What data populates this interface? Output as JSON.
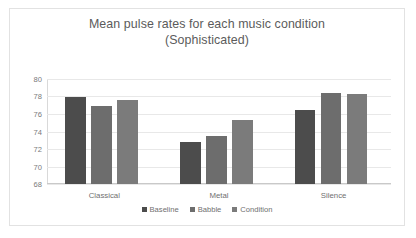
{
  "chart_data": {
    "type": "bar",
    "title": "Mean pulse rates for each music condition (Sophisticated)",
    "title_line1": "Mean pulse rates for each music condition",
    "title_line2": "(Sophisticated)",
    "xlabel": "",
    "ylabel": "",
    "categories": [
      "Classical",
      "Metal",
      "Silence"
    ],
    "yticks": [
      80,
      78,
      76,
      74,
      72,
      70,
      68
    ],
    "ylim": [
      68,
      80
    ],
    "grid": true,
    "legend_position": "bottom",
    "series": [
      {
        "name": "Baseline",
        "color": "#4c4c4c",
        "values": [
          78.0,
          72.8,
          76.5
        ]
      },
      {
        "name": "Babble",
        "color": "#6d6d6d",
        "values": [
          76.9,
          73.5,
          78.4
        ]
      },
      {
        "name": "Condition",
        "color": "#7b7b7b",
        "values": [
          77.6,
          75.3,
          78.3
        ]
      }
    ]
  }
}
